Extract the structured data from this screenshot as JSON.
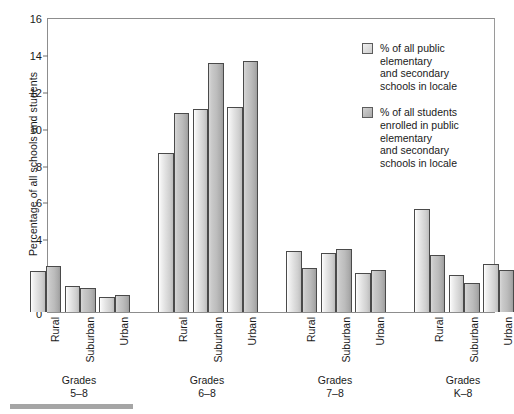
{
  "chart_data": {
    "type": "bar",
    "title": "",
    "xlabel": "",
    "ylabel": "Percentage of all schools and students",
    "ylim": [
      0,
      16
    ],
    "yticks": [
      0,
      2,
      4,
      6,
      8,
      10,
      12,
      14,
      16
    ],
    "grid": false,
    "legend_position": "right",
    "groups": [
      {
        "label": "Grades\n5–8",
        "categories": [
          "Rural",
          "Suburban",
          "Urban"
        ]
      },
      {
        "label": "Grades\n6–8",
        "categories": [
          "Rural",
          "Suburban",
          "Urban"
        ]
      },
      {
        "label": "Grades\n7–8",
        "categories": [
          "Rural",
          "Suburban",
          "Urban"
        ]
      },
      {
        "label": "Grades\nK–8",
        "categories": [
          "Rural",
          "Suburban",
          "Urban"
        ]
      }
    ],
    "categories": [
      "Rural",
      "Suburban",
      "Urban",
      "Rural",
      "Suburban",
      "Urban",
      "Rural",
      "Suburban",
      "Urban",
      "Rural",
      "Suburban",
      "Urban"
    ],
    "series": [
      {
        "name": "% of all public\nelementary\nand secondary\nschools in locale",
        "values": [
          2.2,
          1.4,
          0.8,
          8.6,
          11.0,
          11.1,
          3.3,
          3.2,
          2.1,
          5.6,
          2.0,
          2.6
        ]
      },
      {
        "name": "% of all students\nenrolled in public\nelementary\nand secondary\nschools in locale",
        "values": [
          2.5,
          1.3,
          0.9,
          10.8,
          13.5,
          13.6,
          2.4,
          3.4,
          2.3,
          3.1,
          1.6,
          2.3
        ]
      }
    ],
    "colors": {
      "series_0": "#e2e2e2",
      "series_1": "#b5b5b5",
      "axis": "#8d8d8d",
      "text": "#1a1a1a"
    }
  }
}
